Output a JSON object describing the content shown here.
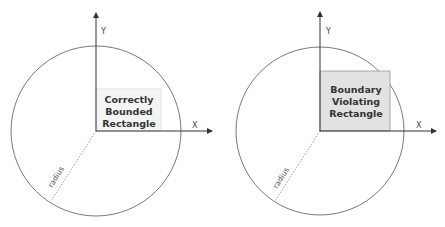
{
  "diagrams": [
    {
      "id": "left",
      "title": "Correctly Bounded Rectangle",
      "rect_label_lines": [
        "Correctly",
        "Bounded",
        "Rectangle"
      ],
      "x_axis_label": "X",
      "y_axis_label": "Y",
      "radius_label": "radius",
      "rect_fill": "#f4f4f4",
      "rect_stroke": "#dddddd"
    },
    {
      "id": "right",
      "title": "Boundary Violating Rectangle",
      "rect_label_lines": [
        "Boundary",
        "Violating",
        "Rectangle"
      ],
      "x_axis_label": "X",
      "y_axis_label": "Y",
      "radius_label": "radius",
      "rect_fill": "#e2e2e2",
      "rect_stroke": "#999999"
    }
  ],
  "colors": {
    "axis": "#333333",
    "circle": "#555555",
    "radius_line": "#777777"
  }
}
